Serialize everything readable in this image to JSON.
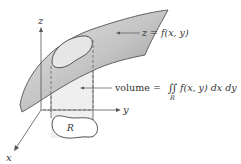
{
  "axes": {
    "z_label": "z",
    "y_label": "y",
    "x_label": "x"
  },
  "region_label": "R",
  "surface_label": "z = f(x, y)",
  "volume_label": {
    "prefix": "volume = ",
    "integral": "∬",
    "integrand": "f(x, y) dx dy",
    "subscript": "R"
  },
  "colors": {
    "surface_fill": "#a9a9a9",
    "surface_light": "#d6d6d6",
    "solid_fill": "#ececec",
    "stroke": "#555555",
    "axis": "#555555"
  }
}
